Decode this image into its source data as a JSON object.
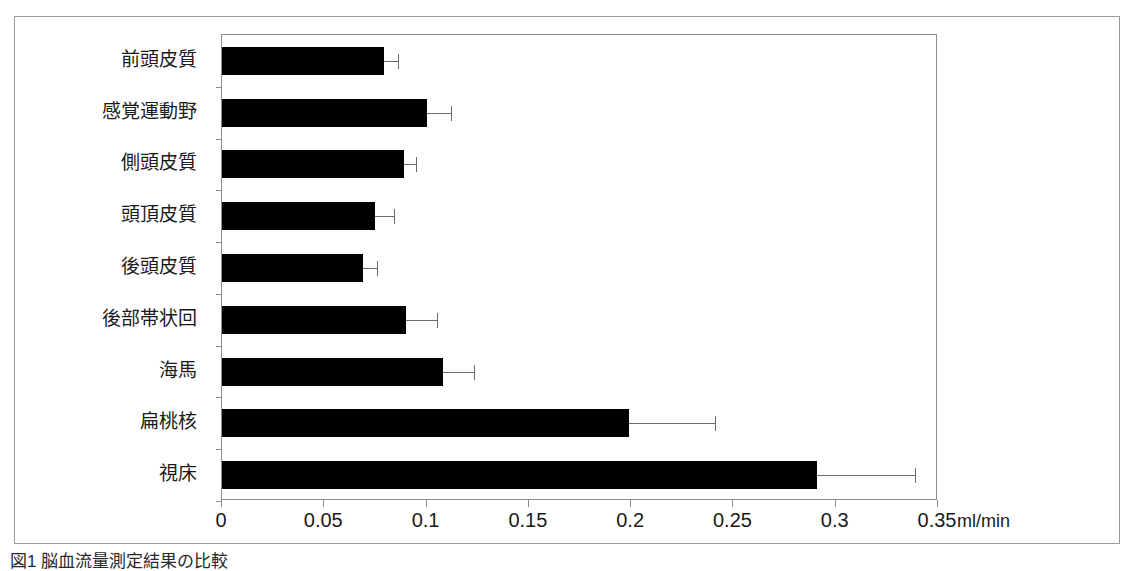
{
  "figure": {
    "caption": "図1 脳血流量測定結果の比較",
    "unit_label": "ml/min"
  },
  "axis": {
    "x_tick_labels": [
      "0",
      "0.05",
      "0.1",
      "0.15",
      "0.2",
      "0.25",
      "0.3",
      "0.35"
    ],
    "x_min": 0,
    "x_max": 0.35,
    "x_step": 0.05
  },
  "colors": {
    "bar_fill": "#000000",
    "error_bar": "#6b6b6b",
    "axis_line": "#8d8d8d",
    "figure_border": "#9a9a9a",
    "background": "#ffffff",
    "text": "#1a1a1a"
  },
  "chart_data": {
    "type": "bar",
    "orientation": "horizontal",
    "title": "",
    "xlabel": "ml/min",
    "ylabel": "",
    "xlim": [
      0,
      0.35
    ],
    "grid": false,
    "legend": "none",
    "categories": [
      "前頭皮質",
      "感覚運動野",
      "側頭皮質",
      "頭頂皮質",
      "後頭皮質",
      "後部帯状回",
      "海馬",
      "扁桃核",
      "視床"
    ],
    "values": [
      0.079,
      0.1,
      0.089,
      0.075,
      0.069,
      0.09,
      0.108,
      0.199,
      0.291
    ],
    "error_upper": [
      0.007,
      0.012,
      0.006,
      0.009,
      0.007,
      0.015,
      0.015,
      0.042,
      0.048
    ],
    "error_bar_tips": [
      0.086,
      0.112,
      0.095,
      0.084,
      0.076,
      0.105,
      0.123,
      0.241,
      0.339
    ],
    "units": "ml/min"
  }
}
